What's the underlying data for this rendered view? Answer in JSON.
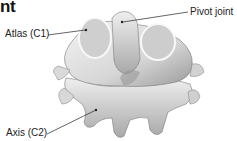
{
  "diagram": {
    "title_fragment": "nt",
    "labels": [
      {
        "text": "Atlas (C1)",
        "points_to": "atlas-vertebra"
      },
      {
        "text": "Pivot joint",
        "points_to": "dens-of-axis"
      },
      {
        "text": "Axis (C2)",
        "points_to": "axis-vertebra"
      }
    ],
    "colors": {
      "bone": "#e8e8e8",
      "bone_shadow": "#8a8a8a",
      "leader_line": "#222222",
      "text": "#222222"
    }
  }
}
